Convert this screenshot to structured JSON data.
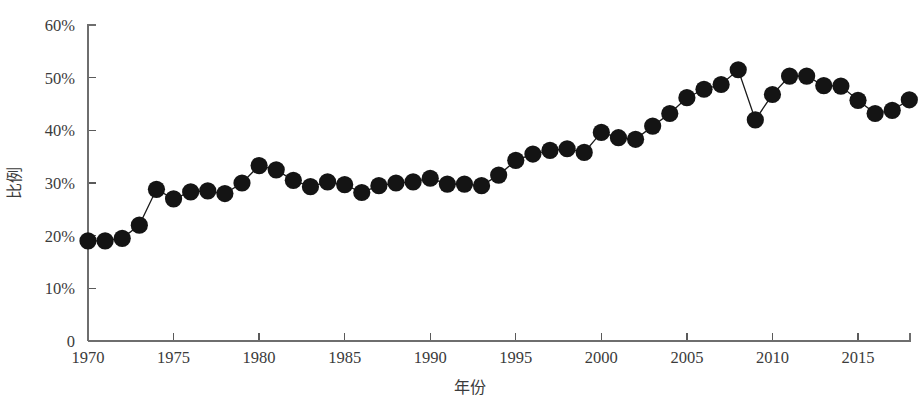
{
  "chart_data": {
    "type": "line",
    "title": "",
    "subtitle": "",
    "xlabel": "年份",
    "ylabel": "比例",
    "xlim": [
      1969.2,
      2018.6
    ],
    "ylim": [
      0,
      60
    ],
    "grid": false,
    "legend": null,
    "marker": "filled-circle",
    "marker_color": "#141414",
    "line_color": "#1a1a1a",
    "x_tick_labels": [
      "1970",
      "1975",
      "1980",
      "1985",
      "1990",
      "1995",
      "2000",
      "2005",
      "2010",
      "2015"
    ],
    "x_tick_values": [
      1970,
      1975,
      1980,
      1985,
      1990,
      1995,
      2000,
      2005,
      2010,
      2015
    ],
    "y_tick_labels": [
      "0",
      "10%",
      "20%",
      "30%",
      "40%",
      "50%",
      "60%"
    ],
    "y_tick_values": [
      0,
      10,
      20,
      30,
      40,
      50,
      60
    ],
    "x": [
      1970,
      1971,
      1972,
      1973,
      1974,
      1975,
      1976,
      1977,
      1978,
      1979,
      1980,
      1981,
      1982,
      1983,
      1984,
      1985,
      1986,
      1987,
      1988,
      1989,
      1990,
      1991,
      1992,
      1993,
      1994,
      1995,
      1996,
      1997,
      1998,
      1999,
      2000,
      2001,
      2002,
      2003,
      2004,
      2005,
      2006,
      2007,
      2008,
      2009,
      2010,
      2011,
      2012,
      2013,
      2014,
      2015,
      2016,
      2017,
      2018
    ],
    "values": [
      19.0,
      19.0,
      19.5,
      22.0,
      28.8,
      27.0,
      28.3,
      28.5,
      28.0,
      30.0,
      33.3,
      32.5,
      30.5,
      29.3,
      30.2,
      29.7,
      28.2,
      29.5,
      30.0,
      30.2,
      30.9,
      29.8,
      29.8,
      29.5,
      31.5,
      34.3,
      35.5,
      36.2,
      36.5,
      35.8,
      39.6,
      38.6,
      38.3,
      40.8,
      43.2,
      46.2,
      47.8,
      48.7,
      51.5,
      42.0,
      46.8,
      50.3,
      50.3,
      48.5,
      48.4,
      45.7,
      43.2,
      43.8,
      45.8
    ],
    "series": [
      {
        "name": "比例",
        "values": [
          19.0,
          19.0,
          19.5,
          22.0,
          28.8,
          27.0,
          28.3,
          28.5,
          28.0,
          30.0,
          33.3,
          32.5,
          30.5,
          29.3,
          30.2,
          29.7,
          28.2,
          29.5,
          30.0,
          30.2,
          30.9,
          29.8,
          29.8,
          29.5,
          31.5,
          34.3,
          35.5,
          36.2,
          36.5,
          35.8,
          39.6,
          38.6,
          38.3,
          40.8,
          43.2,
          46.2,
          47.8,
          48.7,
          51.5,
          42.0,
          46.8,
          50.3,
          50.3,
          48.5,
          48.4,
          45.7,
          43.2,
          43.8,
          45.8
        ]
      }
    ]
  }
}
